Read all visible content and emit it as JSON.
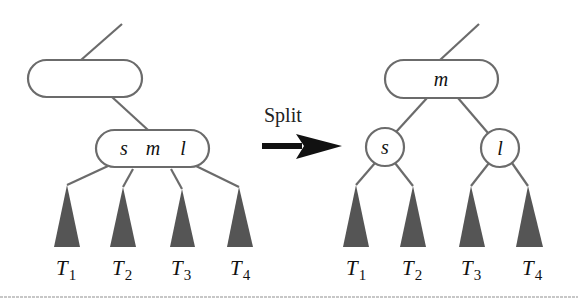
{
  "diagram": {
    "type": "tree-node-split",
    "operation_label": "Split",
    "before": {
      "parent_node": {
        "label": ""
      },
      "node": {
        "keys": [
          "s",
          "m",
          "l"
        ]
      },
      "subtrees": [
        {
          "base": "T",
          "sub": "1"
        },
        {
          "base": "T",
          "sub": "2"
        },
        {
          "base": "T",
          "sub": "3"
        },
        {
          "base": "T",
          "sub": "4"
        }
      ]
    },
    "after": {
      "parent_node": {
        "label": "m"
      },
      "left_child": {
        "label": "s"
      },
      "right_child": {
        "label": "l"
      },
      "subtrees": [
        {
          "base": "T",
          "sub": "1"
        },
        {
          "base": "T",
          "sub": "2"
        },
        {
          "base": "T",
          "sub": "3"
        },
        {
          "base": "T",
          "sub": "4"
        }
      ]
    },
    "colors": {
      "stroke": "#6b6b6b",
      "subtree_fill": "#555555",
      "arrow": "#111111",
      "text": "#111111"
    }
  }
}
